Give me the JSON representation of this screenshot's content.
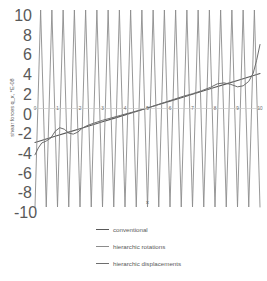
{
  "chart_data": {
    "type": "line",
    "title": "",
    "xlabel": "x",
    "ylabel": "shear forces q_x, *E-08",
    "xlim": [
      0,
      10
    ],
    "ylim": [
      -10,
      10
    ],
    "xticks": [
      0,
      1,
      2,
      3,
      4,
      5,
      6,
      7,
      8,
      9,
      10
    ],
    "yticks": [
      10,
      8,
      6,
      4,
      2,
      0,
      -2,
      -4,
      -6,
      -8,
      -10
    ],
    "xtick_labels": [
      "0",
      "1",
      "2",
      "3",
      "4",
      "5",
      "6",
      "7",
      "8",
      "9",
      "10"
    ],
    "ytick_labels": [
      "10",
      "8",
      "6",
      "4",
      "2",
      "0",
      "-2",
      "-4",
      "-6",
      "-8",
      "-10"
    ],
    "grid": false,
    "zero_line": true,
    "legend_position": "below",
    "series": [
      {
        "name": "conventional",
        "color": "#595959",
        "width": 1.1,
        "x": [
          0,
          0.5,
          1,
          1.5,
          2,
          2.5,
          3,
          3.5,
          4,
          4.5,
          5,
          5.5,
          6,
          6.5,
          7,
          7.5,
          8,
          8.5,
          9,
          9.5,
          10
        ],
        "values": [
          -3.45,
          -3.1,
          -2.75,
          -2.4,
          -2.05,
          -1.7,
          -1.35,
          -1.0,
          -0.65,
          -0.3,
          0.05,
          0.4,
          0.75,
          1.1,
          1.45,
          1.8,
          2.15,
          2.5,
          2.85,
          3.2,
          3.55
        ]
      },
      {
        "name": "hierarchic rotations",
        "color": "#8c8c8c",
        "width": 0.9,
        "x": [
          0,
          0.25,
          0.5,
          0.75,
          1,
          1.25,
          1.5,
          1.75,
          2,
          2.25,
          2.5,
          2.75,
          3,
          3.25,
          3.5,
          3.75,
          4,
          4.25,
          4.5,
          4.75,
          5,
          5.25,
          5.5,
          5.75,
          6,
          6.25,
          6.5,
          6.75,
          7,
          7.25,
          7.5,
          7.75,
          8,
          8.25,
          8.5,
          8.75,
          9,
          9.25,
          9.5,
          9.75,
          10
        ],
        "values": [
          -10,
          10,
          -10,
          10,
          -10,
          10,
          -10,
          10,
          -10,
          10,
          -10,
          10,
          -10,
          10,
          -10,
          10,
          -10,
          10,
          -10,
          10,
          -10,
          10,
          -10,
          10,
          -10,
          10,
          -10,
          10,
          -10,
          10,
          -10,
          10,
          -10,
          10,
          -10,
          10,
          -10,
          10,
          -10,
          10,
          -10
        ],
        "note": "oscillates between plot top and bottom, rendered as vertical spikes"
      },
      {
        "name": "hierarchic displacements",
        "color": "#6e6e6e",
        "width": 1.0,
        "x": [
          0,
          0.15,
          0.3,
          0.5,
          0.7,
          0.9,
          1.1,
          1.3,
          1.5,
          1.7,
          1.9,
          2.1,
          2.3,
          2.6,
          3,
          3.4,
          3.8,
          4.2,
          4.6,
          5,
          5.4,
          5.8,
          6.2,
          6.6,
          7,
          7.4,
          7.8,
          8.1,
          8.4,
          8.7,
          9,
          9.25,
          9.5,
          9.7,
          9.85,
          10
        ],
        "values": [
          -4.7,
          -4.0,
          -3.5,
          -3.3,
          -3.0,
          -2.3,
          -1.95,
          -2.1,
          -2.5,
          -2.6,
          -2.4,
          -2.0,
          -1.75,
          -1.5,
          -1.2,
          -0.95,
          -0.7,
          -0.45,
          -0.2,
          0.05,
          0.35,
          0.65,
          0.95,
          1.25,
          1.5,
          1.8,
          2.15,
          2.5,
          2.6,
          2.45,
          2.2,
          2.3,
          2.75,
          3.6,
          4.9,
          6.5
        ]
      }
    ]
  },
  "legend": {
    "items": [
      {
        "label": "conventional",
        "color": "#595959"
      },
      {
        "label": "hierarchic rotations",
        "color": "#8c8c8c"
      },
      {
        "label": "hierarchic displacements",
        "color": "#6e6e6e"
      }
    ]
  },
  "axes": {
    "y_title": "shear forces q_x, *E-08",
    "x_title": "x"
  }
}
